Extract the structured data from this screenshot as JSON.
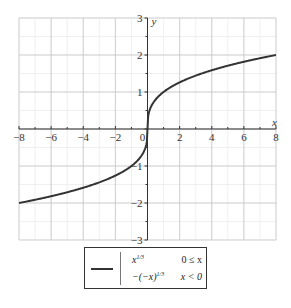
{
  "chart_data": {
    "type": "line",
    "title": "",
    "xlabel": "x",
    "ylabel": "y",
    "xlim": [
      -8,
      8
    ],
    "ylim": [
      -3,
      3
    ],
    "grid": true,
    "x_ticks": [
      -8,
      -6,
      -4,
      -2,
      0,
      2,
      4,
      6,
      8
    ],
    "y_ticks": [
      -3,
      -2,
      -1,
      1,
      2,
      3
    ],
    "x_tick_labels": [
      "−8",
      "−6",
      "−4",
      "−2",
      "0",
      "2",
      "4",
      "6",
      "8"
    ],
    "y_tick_labels": [
      "−3",
      "−2",
      "−1",
      "1",
      "2",
      "3"
    ],
    "series": [
      {
        "name": "piecewise cube root",
        "function": "x^(1/3) for 0 ≤ x; -(-x)^(1/3) for x < 0",
        "color": "#333333",
        "x": [
          -8,
          -6,
          -4,
          -2,
          -1,
          -0.5,
          -0.1,
          0,
          0.1,
          0.5,
          1,
          2,
          4,
          6,
          8
        ],
        "y": [
          -2,
          -1.817,
          -1.587,
          -1.26,
          -1,
          -0.794,
          -0.464,
          0,
          0.464,
          0.794,
          1,
          1.26,
          1.587,
          1.817,
          2
        ]
      }
    ],
    "legend": {
      "position": "bottom-center",
      "entries": [
        {
          "expr": "x^(1/3)",
          "expr_display": "x",
          "exp": "1/3",
          "condition": "0 ≤ x"
        },
        {
          "expr": "-(-x)^(1/3)",
          "expr_display": "−(−x)",
          "exp": "1/3",
          "condition": "x < 0"
        }
      ]
    }
  },
  "legend": {
    "row1_expr": "x",
    "row1_exp": "1/3",
    "row1_cond": "0 ≤ x",
    "row2_expr": "−(−x)",
    "row2_exp": "1/3",
    "row2_cond": "x < 0"
  },
  "axes": {
    "x_label": "x",
    "y_label": "y"
  },
  "colors": {
    "curve": "#333333",
    "grid_major": "#c8c8c8",
    "grid_minor": "#e6e6e6",
    "axis": "#333333"
  }
}
